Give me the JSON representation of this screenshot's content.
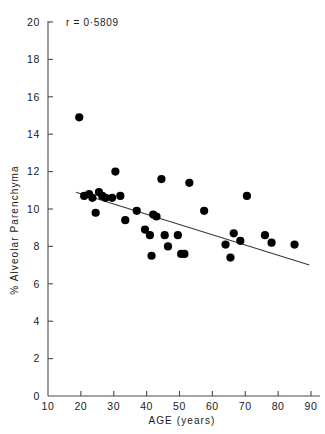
{
  "chart_data": {
    "type": "scatter",
    "title": "",
    "xlabel": "AGE   (years)",
    "ylabel": "% Alveolar Parenchyma",
    "xlim": [
      10,
      90
    ],
    "ylim": [
      0,
      20
    ],
    "xticks": [
      10,
      20,
      30,
      40,
      50,
      60,
      70,
      80,
      90
    ],
    "xtick_labels": [
      "10",
      "20",
      "30",
      "40",
      "50",
      "60",
      "70",
      "80",
      "90"
    ],
    "yticks": [
      0,
      2,
      4,
      6,
      8,
      10,
      12,
      14,
      16,
      18,
      20
    ],
    "ytick_labels": [
      "0",
      "2",
      "4",
      "6",
      "8",
      "10",
      "12",
      "14",
      "16",
      "18",
      "20"
    ],
    "grid": false,
    "legend": null,
    "annotation": "r = 0·5809",
    "marker_color": "#000000",
    "marker_size": 4.1,
    "line_color": "#3a3a3a",
    "axis_color": "#4a4a4a",
    "points": [
      {
        "x": 19.5,
        "y": 14.9
      },
      {
        "x": 21.0,
        "y": 10.7
      },
      {
        "x": 22.5,
        "y": 10.8
      },
      {
        "x": 23.5,
        "y": 10.6
      },
      {
        "x": 24.5,
        "y": 9.8
      },
      {
        "x": 25.5,
        "y": 10.9
      },
      {
        "x": 26.5,
        "y": 10.7
      },
      {
        "x": 27.5,
        "y": 10.6
      },
      {
        "x": 29.5,
        "y": 10.6
      },
      {
        "x": 30.5,
        "y": 12.0
      },
      {
        "x": 32.0,
        "y": 10.7
      },
      {
        "x": 33.5,
        "y": 9.4
      },
      {
        "x": 37.0,
        "y": 9.9
      },
      {
        "x": 39.5,
        "y": 8.9
      },
      {
        "x": 41.0,
        "y": 8.6
      },
      {
        "x": 41.5,
        "y": 7.5
      },
      {
        "x": 42.0,
        "y": 9.7
      },
      {
        "x": 43.0,
        "y": 9.6
      },
      {
        "x": 44.5,
        "y": 11.6
      },
      {
        "x": 45.5,
        "y": 8.6
      },
      {
        "x": 46.5,
        "y": 8.0
      },
      {
        "x": 49.5,
        "y": 8.6
      },
      {
        "x": 50.5,
        "y": 7.6
      },
      {
        "x": 51.5,
        "y": 7.6
      },
      {
        "x": 53.0,
        "y": 11.4
      },
      {
        "x": 57.5,
        "y": 9.9
      },
      {
        "x": 64.0,
        "y": 8.1
      },
      {
        "x": 65.5,
        "y": 7.4
      },
      {
        "x": 66.5,
        "y": 8.7
      },
      {
        "x": 68.5,
        "y": 8.3
      },
      {
        "x": 70.5,
        "y": 10.7
      },
      {
        "x": 76.0,
        "y": 8.6
      },
      {
        "x": 78.0,
        "y": 8.2
      },
      {
        "x": 85.0,
        "y": 8.1
      }
    ],
    "fit_line": {
      "x_start": 18.5,
      "y_start": 10.9,
      "x_end": 89.5,
      "y_end": 7.0
    }
  }
}
